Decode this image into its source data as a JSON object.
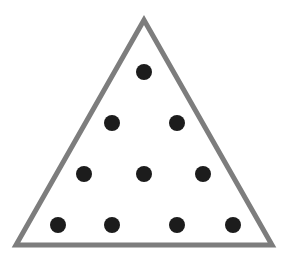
{
  "diagram": {
    "type": "triangular-dot-pattern",
    "background": "#ffffff",
    "triangle": {
      "vertices": [
        [
          144,
          20
        ],
        [
          16,
          245
        ],
        [
          272,
          245
        ]
      ],
      "stroke": "#7d7d7d",
      "stroke_width": 5,
      "fill": "#ffffff"
    },
    "dots": {
      "color": "#1c1c1c",
      "radius": 8,
      "rows": [
        [
          [
            144,
            72
          ]
        ],
        [
          [
            112,
            123
          ],
          [
            177,
            123
          ]
        ],
        [
          [
            84,
            174
          ],
          [
            144,
            174
          ],
          [
            203,
            174
          ]
        ],
        [
          [
            58,
            225
          ],
          [
            112,
            225
          ],
          [
            177,
            225
          ],
          [
            233,
            225
          ]
        ]
      ],
      "count": 10
    }
  }
}
